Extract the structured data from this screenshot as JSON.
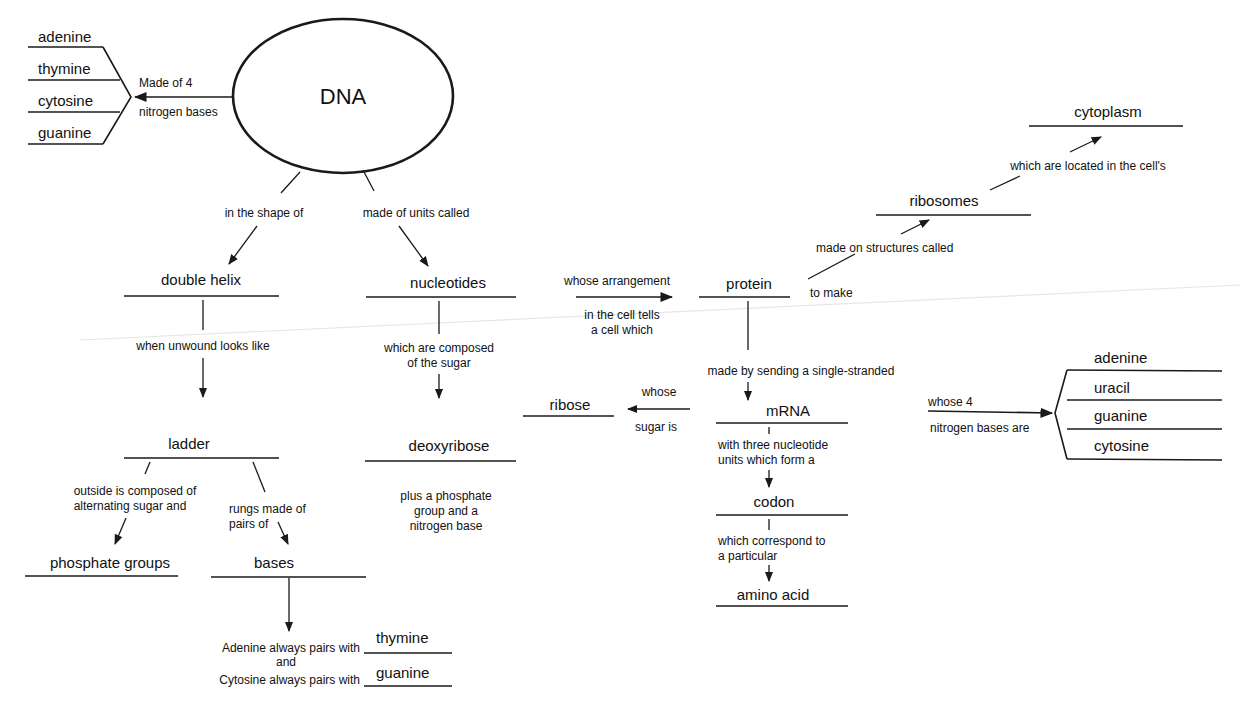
{
  "diagram": {
    "title": "DNA",
    "colors": {
      "ink": "#1a1a1a",
      "background": "#ffffff",
      "scan_line": "#e6e6e6"
    },
    "dna_bases": {
      "link": [
        "Made of 4",
        "nitrogen bases"
      ],
      "items": [
        "adenine",
        "thymine",
        "cytosine",
        "guanine"
      ]
    },
    "left_branch": {
      "link1": "in the shape of",
      "node1": "double helix",
      "link2": "when unwound looks like",
      "node2": "ladder",
      "link_outside": [
        "outside is composed of",
        "alternating sugar and"
      ],
      "node_phosphate": "phosphate groups",
      "link_rungs": [
        "rungs made of",
        "pairs of"
      ],
      "node_bases": "bases",
      "pairing": {
        "line1": "Adenine always pairs with",
        "answer1": "thymine",
        "and": "and",
        "line2": "Cytosine always pairs with",
        "answer2": "guanine"
      }
    },
    "middle_branch": {
      "link1": "made of units called",
      "node1": "nucleotides",
      "link2": [
        "which are composed",
        "of the sugar"
      ],
      "node2": "deoxyribose",
      "note": [
        "plus a phosphate",
        "group and a",
        "nitrogen base"
      ]
    },
    "protein_branch": {
      "link_arrangement": "whose arrangement",
      "link_tells": [
        "in the cell tells",
        "a cell which"
      ],
      "node_protein": "protein",
      "link_to_make": "to make",
      "link_made_on": "made on structures called",
      "node_ribosomes": "ribosomes",
      "link_located": "which are located in the cell's",
      "node_cytoplasm": "cytoplasm",
      "link_sending": "made by sending a single-stranded",
      "node_mrna": "mRNA",
      "link_whose": "whose",
      "link_sugar_is": "sugar is",
      "node_ribose": "ribose",
      "link_three": [
        "with three nucleotide",
        "units which form a"
      ],
      "node_codon": "codon",
      "link_correspond": [
        "which correspond to",
        "a particular"
      ],
      "node_amino": "amino acid"
    },
    "rna_bases": {
      "link": [
        "whose 4",
        "nitrogen bases are"
      ],
      "items": [
        "adenine",
        "uracil",
        "guanine",
        "cytosine"
      ]
    }
  }
}
